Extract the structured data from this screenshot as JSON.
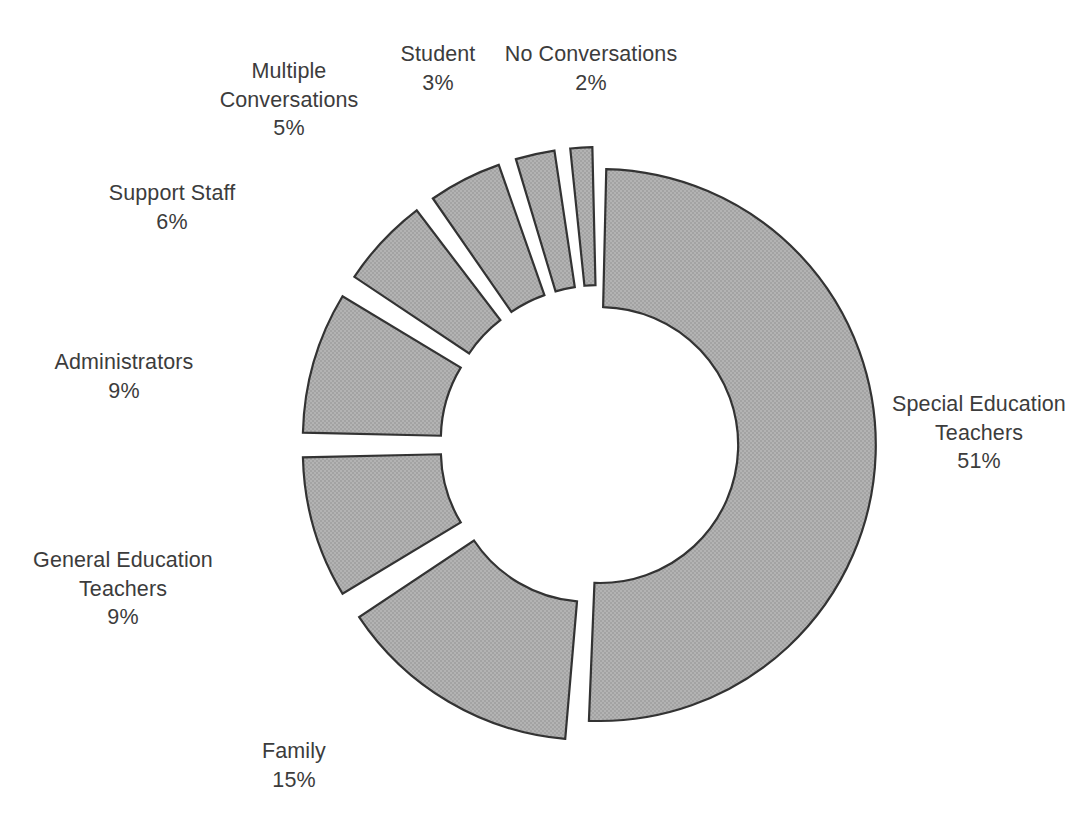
{
  "chart_data": {
    "type": "pie",
    "variant": "exploded-donut",
    "title": "",
    "subtitle": "",
    "xlabel": "",
    "ylabel": "",
    "legend_position": "none",
    "grid": false,
    "value_unit": "%",
    "total": 100,
    "start_angle_deg": 0,
    "direction": "clockwise",
    "inner_radius_ratio": 0.5,
    "categories": [
      "Special Education Teachers",
      "Family",
      "General Education Teachers",
      "Administrators",
      "Support Staff",
      "Multiple Conversations",
      "Student",
      "No Conversations"
    ],
    "values": [
      51,
      15,
      9,
      9,
      6,
      5,
      3,
      2
    ],
    "labels": [
      "51%",
      "15%",
      "9%",
      "9%",
      "6%",
      "5%",
      "3%",
      "2%"
    ],
    "colors": {
      "slice_fill": "#ababab",
      "slice_stroke": "#333333",
      "background": "#ffffff",
      "label_text": "#3c3c3c"
    },
    "slices": [
      {
        "name": "Special Education Teachers",
        "value": 51,
        "value_label": "51%",
        "label_lines": [
          "Special Education",
          "Teachers"
        ],
        "explode": 0,
        "label_left": 872,
        "label_top": 390,
        "label_width": 214,
        "label_align": "center"
      },
      {
        "name": "Family",
        "value": 15,
        "value_label": "15%",
        "label_lines": [
          "Family"
        ],
        "explode": 22,
        "label_left": 214,
        "label_top": 737,
        "label_width": 160,
        "label_align": "center"
      },
      {
        "name": "General Education Teachers",
        "value": 9,
        "value_label": "9%",
        "label_lines": [
          "General Education",
          "Teachers"
        ],
        "explode": 22,
        "label_left": 25,
        "label_top": 546,
        "label_width": 196,
        "label_align": "center"
      },
      {
        "name": "Administrators",
        "value": 9,
        "value_label": "9%",
        "label_lines": [
          "Administrators"
        ],
        "explode": 22,
        "label_left": 37,
        "label_top": 348,
        "label_width": 174,
        "label_align": "center"
      },
      {
        "name": "Support Staff",
        "value": 6,
        "value_label": "6%",
        "label_lines": [
          "Support Staff"
        ],
        "explode": 22,
        "label_left": 96,
        "label_top": 179,
        "label_width": 152,
        "label_align": "center"
      },
      {
        "name": "Multiple Conversations",
        "value": 5,
        "value_label": "5%",
        "label_lines": [
          "Multiple",
          "Conversations"
        ],
        "explode": 22,
        "label_left": 212,
        "label_top": 57,
        "label_width": 154,
        "label_align": "center"
      },
      {
        "name": "Student",
        "value": 3,
        "value_label": "3%",
        "label_lines": [
          "Student"
        ],
        "explode": 22,
        "label_left": 375,
        "label_top": 40,
        "label_width": 126,
        "label_align": "center"
      },
      {
        "name": "No Conversations",
        "value": 2,
        "value_label": "2%",
        "label_lines": [
          "No Conversations"
        ],
        "explode": 22,
        "label_left": 489,
        "label_top": 40,
        "label_width": 204,
        "label_align": "center"
      }
    ],
    "geometry": {
      "center_x": 600,
      "center_y": 445,
      "outer_radius": 276,
      "inner_radius": 138,
      "gap_deg": 2.6
    }
  }
}
